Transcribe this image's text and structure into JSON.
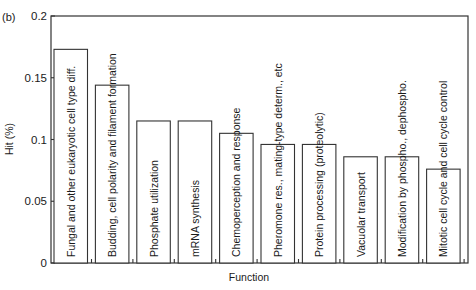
{
  "chart_data": {
    "type": "bar",
    "panel_label": "(b)",
    "title": "",
    "xlabel": "Function",
    "ylabel": "Hit (%)",
    "ylim": [
      0,
      0.2
    ],
    "yticks": [
      0,
      0.05,
      0.1,
      0.15,
      0.2
    ],
    "ytick_labels": [
      "0",
      "0.05",
      "0.1",
      "0.15",
      "0.2"
    ],
    "grid": false,
    "legend": "none",
    "categories": [
      "Fungal and other eukaryotic cell type diff.",
      "Budding, cell polarity and filament formation",
      "Phosphate utilization",
      "mRNA synthesis",
      "Chemoperception and response",
      "Pheromone res., mating-type determ., etc",
      "Protein processing (proteolytic)",
      "Vacuolar transport",
      "Modification by phospho., dephospho.",
      "Mitotic cell cycle and cell cycle control"
    ],
    "values": [
      0.173,
      0.144,
      0.115,
      0.115,
      0.105,
      0.096,
      0.096,
      0.086,
      0.086,
      0.076
    ]
  }
}
